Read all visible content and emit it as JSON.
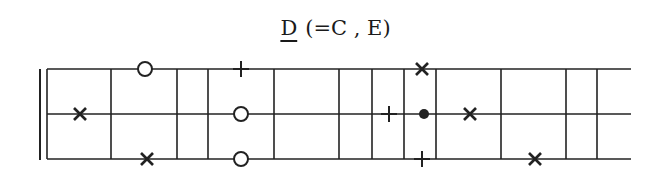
{
  "title": {
    "key": "D",
    "equivalents": "(=C , E)"
  },
  "diagram": {
    "ink_color": "#222222",
    "double_bar_x": [
      40,
      47
    ],
    "strings": [
      {
        "name": "top",
        "y": 69
      },
      {
        "name": "middle",
        "y": 114
      },
      {
        "name": "bottom",
        "y": 159
      }
    ],
    "string_start_x": 47,
    "string_end_x": 631,
    "frets_x": [
      47,
      111,
      177,
      208,
      274,
      339,
      372,
      404,
      436,
      501,
      566,
      597
    ],
    "markers": [
      {
        "type": "circle",
        "x": 145,
        "string": "top"
      },
      {
        "type": "plus",
        "x": 241,
        "string": "top"
      },
      {
        "type": "x",
        "x": 422,
        "string": "top"
      },
      {
        "type": "x",
        "x": 80,
        "string": "middle"
      },
      {
        "type": "circle",
        "x": 241,
        "string": "middle"
      },
      {
        "type": "plus",
        "x": 389,
        "string": "middle"
      },
      {
        "type": "dot",
        "x": 424,
        "string": "middle"
      },
      {
        "type": "x",
        "x": 470,
        "string": "middle"
      },
      {
        "type": "x",
        "x": 147,
        "string": "bottom"
      },
      {
        "type": "circle",
        "x": 241,
        "string": "bottom"
      },
      {
        "type": "plus",
        "x": 422,
        "string": "bottom"
      },
      {
        "type": "x",
        "x": 535,
        "string": "bottom"
      }
    ]
  }
}
